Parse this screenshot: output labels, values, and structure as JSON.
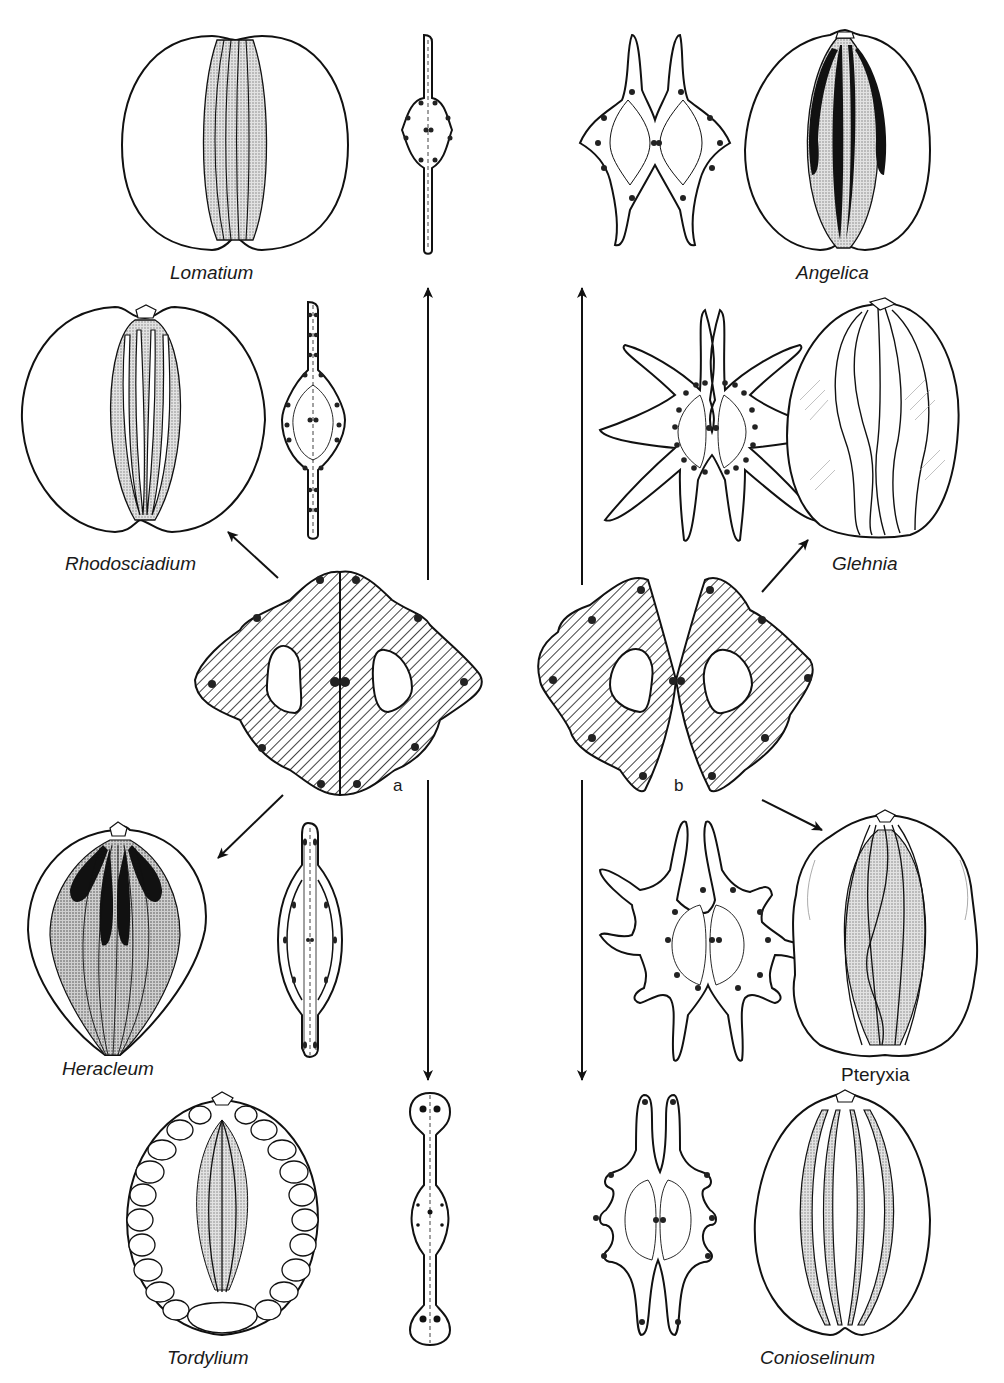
{
  "figure": {
    "ink_color": "#111111",
    "stipple_color": "#c9c9c9",
    "oil_tube_color": "#111111",
    "background": "#ffffff"
  },
  "central_types": [
    {
      "id": "a",
      "label": "a",
      "description": "dorsally compressed hatched cross-section, commissure broad"
    },
    {
      "id": "b",
      "label": "b",
      "description": "hatched cross-section, commissure constricted"
    }
  ],
  "genera": [
    {
      "name": "Lomatium",
      "italic": true,
      "position": "top-left",
      "derived_from": "a"
    },
    {
      "name": "Angelica",
      "italic": true,
      "position": "top-right",
      "derived_from": "b"
    },
    {
      "name": "Rhodosciadium",
      "italic": true,
      "position": "upper-left",
      "derived_from": "a"
    },
    {
      "name": "Glehnia",
      "italic": true,
      "position": "upper-right",
      "derived_from": "b"
    },
    {
      "name": "Heracleum",
      "italic": true,
      "position": "lower-left",
      "derived_from": "a"
    },
    {
      "name": "Pteryxia",
      "italic": false,
      "position": "lower-right",
      "derived_from": "b"
    },
    {
      "name": "Tordylium",
      "italic": true,
      "position": "bottom-left",
      "derived_from": "a"
    },
    {
      "name": "Conioselinum",
      "italic": true,
      "position": "bottom-right",
      "derived_from": "b"
    }
  ],
  "arrows": [
    {
      "from": "a",
      "to": "Lomatium",
      "direction": "up"
    },
    {
      "from": "a",
      "to": "Rhodosciadium",
      "direction": "up-left"
    },
    {
      "from": "a",
      "to": "Heracleum",
      "direction": "down-left"
    },
    {
      "from": "a",
      "to": "Tordylium",
      "direction": "down"
    },
    {
      "from": "b",
      "to": "Angelica",
      "direction": "up"
    },
    {
      "from": "b",
      "to": "Glehnia",
      "direction": "up-right"
    },
    {
      "from": "b",
      "to": "Pteryxia",
      "direction": "down-right"
    },
    {
      "from": "b",
      "to": "Conioselinum",
      "direction": "down"
    }
  ]
}
